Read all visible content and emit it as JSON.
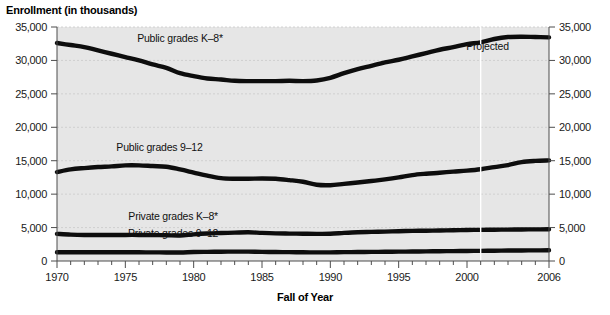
{
  "chart_data": {
    "type": "line",
    "title": "",
    "ylabel": "Enrollment (in thousands)",
    "xlabel": "Fall of Year",
    "ylim": [
      0,
      35000
    ],
    "xlim": [
      1970,
      2006
    ],
    "grid": true,
    "legend_position": "inline-labels",
    "y_ticks": [
      "0",
      "5,000",
      "10,000",
      "15,000",
      "20,000",
      "25,000",
      "30,000",
      "35,000"
    ],
    "y_tick_values": [
      0,
      5000,
      10000,
      15000,
      20000,
      25000,
      30000,
      35000
    ],
    "x_ticks": [
      "1970",
      "1975",
      "1980",
      "1985",
      "1990",
      "1995",
      "2000",
      "2006"
    ],
    "x_tick_values": [
      1970,
      1975,
      1980,
      1985,
      1990,
      1995,
      2000,
      2006
    ],
    "x_minor_step": 1,
    "annotations": [
      {
        "text": "Projected",
        "x": 2001.5,
        "y": 31600
      }
    ],
    "projection_divider_year": 2001,
    "series": [
      {
        "name": "Public grades K–8*",
        "label_x": 1979.0,
        "label_y": 32700,
        "x": [
          1970,
          1971,
          1972,
          1973,
          1974,
          1975,
          1976,
          1977,
          1978,
          1979,
          1980,
          1981,
          1982,
          1983,
          1984,
          1985,
          1986,
          1987,
          1988,
          1989,
          1990,
          1991,
          1992,
          1993,
          1994,
          1995,
          1996,
          1997,
          1998,
          1999,
          2000,
          2001,
          2002,
          2003,
          2004,
          2005,
          2006
        ],
        "values": [
          32600,
          32300,
          32000,
          31500,
          31000,
          30500,
          30000,
          29400,
          28900,
          28100,
          27650,
          27300,
          27150,
          26950,
          26900,
          26900,
          26900,
          26950,
          26900,
          27000,
          27400,
          28100,
          28700,
          29200,
          29700,
          30100,
          30600,
          31100,
          31600,
          32000,
          32450,
          32700,
          33200,
          33500,
          33550,
          33500,
          33450
        ]
      },
      {
        "name": "Public grades 9–12",
        "label_x": 1977.5,
        "label_y": 16400,
        "x": [
          1970,
          1971,
          1972,
          1973,
          1974,
          1975,
          1976,
          1977,
          1978,
          1979,
          1980,
          1981,
          1982,
          1983,
          1984,
          1985,
          1986,
          1987,
          1988,
          1989,
          1990,
          1991,
          1992,
          1993,
          1994,
          1995,
          1996,
          1997,
          1998,
          1999,
          2000,
          2001,
          2002,
          2003,
          2004,
          2005,
          2006
        ],
        "values": [
          13300,
          13700,
          13900,
          14050,
          14150,
          14300,
          14300,
          14200,
          14100,
          13700,
          13230,
          12760,
          12400,
          12300,
          12300,
          12350,
          12300,
          12100,
          11850,
          11400,
          11340,
          11540,
          11740,
          11960,
          12210,
          12500,
          12850,
          13050,
          13200,
          13370,
          13520,
          13730,
          14050,
          14350,
          14800,
          14980,
          15050
        ]
      },
      {
        "name": "Private grades K–8*",
        "label_x": 1978.5,
        "label_y": 6100,
        "x": [
          1970,
          1971,
          1972,
          1973,
          1974,
          1975,
          1976,
          1977,
          1978,
          1979,
          1980,
          1981,
          1982,
          1983,
          1984,
          1985,
          1986,
          1987,
          1988,
          1989,
          1990,
          1991,
          1992,
          1993,
          1994,
          1995,
          1996,
          1997,
          1998,
          1999,
          2000,
          2001,
          2002,
          2003,
          2004,
          2005,
          2006
        ],
        "values": [
          4050,
          3950,
          3900,
          3900,
          3900,
          3900,
          3900,
          3880,
          3860,
          3820,
          3990,
          4110,
          4180,
          4240,
          4300,
          4200,
          4130,
          4100,
          4080,
          4060,
          4080,
          4200,
          4300,
          4350,
          4400,
          4460,
          4500,
          4530,
          4570,
          4600,
          4640,
          4660,
          4680,
          4700,
          4720,
          4730,
          4740
        ]
      },
      {
        "name": "Private grades 9–12",
        "label_x": 1978.5,
        "label_y": 3600,
        "x": [
          1970,
          1971,
          1972,
          1973,
          1974,
          1975,
          1976,
          1977,
          1978,
          1979,
          1980,
          1981,
          1982,
          1983,
          1984,
          1985,
          1986,
          1987,
          1988,
          1989,
          1990,
          1991,
          1992,
          1993,
          1994,
          1995,
          1996,
          1997,
          1998,
          1999,
          2000,
          2001,
          2002,
          2003,
          2004,
          2005,
          2006
        ],
        "values": [
          1310,
          1300,
          1300,
          1300,
          1300,
          1300,
          1300,
          1290,
          1280,
          1270,
          1340,
          1370,
          1390,
          1400,
          1400,
          1370,
          1340,
          1320,
          1300,
          1290,
          1290,
          1320,
          1340,
          1360,
          1380,
          1400,
          1420,
          1440,
          1460,
          1480,
          1500,
          1520,
          1540,
          1560,
          1580,
          1590,
          1600
        ]
      }
    ]
  },
  "footnote": ""
}
